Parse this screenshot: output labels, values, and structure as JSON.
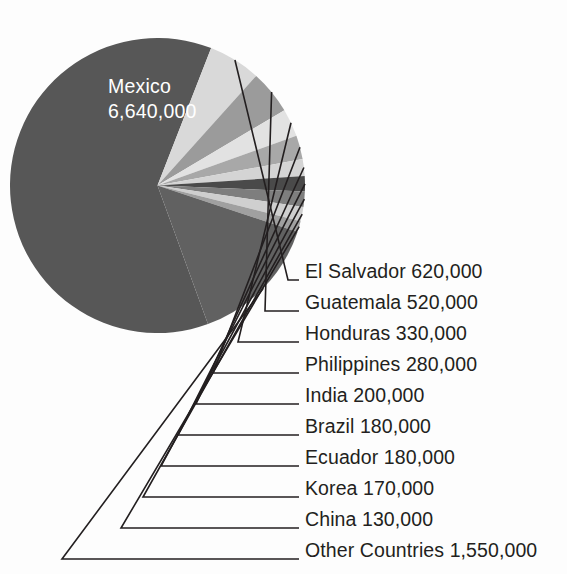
{
  "chart_data": {
    "type": "pie",
    "title": "",
    "subtitle": "",
    "xlabel": "",
    "ylabel": "",
    "legend_position": "callout-labels-right",
    "grid": false,
    "units": "people",
    "total": 10780000,
    "categories": [
      "Mexico",
      "El Salvador",
      "Guatemala",
      "Honduras",
      "Philippines",
      "India",
      "Brazil",
      "Ecuador",
      "Korea",
      "China",
      "Other Countries"
    ],
    "values": [
      6640000,
      620000,
      520000,
      330000,
      280000,
      200000,
      180000,
      180000,
      170000,
      130000,
      1550000
    ],
    "value_labels": [
      "6,640,000",
      "620,000",
      "520,000",
      "330,000",
      "280,000",
      "200,000",
      "180,000",
      "180,000",
      "170,000",
      "130,000",
      "1,550,000"
    ],
    "slice_colors": [
      "#575757",
      "#d9d9d9",
      "#9b9b9b",
      "#e2e2e2",
      "#a8a8a8",
      "#d4d4d4",
      "#4a4a4a",
      "#7e7e7e",
      "#cfcfcf",
      "#a0a0a0",
      "#616161"
    ]
  },
  "inner_label": {
    "name": "Mexico",
    "value": "6,640,000"
  },
  "callouts": [
    {
      "text": "El Salvador 620,000"
    },
    {
      "text": "Guatemala 520,000"
    },
    {
      "text": "Honduras 330,000"
    },
    {
      "text": "Philippines 280,000"
    },
    {
      "text": "India 200,000"
    },
    {
      "text": "Brazil 180,000"
    },
    {
      "text": "Ecuador 180,000"
    },
    {
      "text": "Korea 170,000"
    },
    {
      "text": "China 130,000"
    },
    {
      "text": "Other Countries 1,550,000"
    }
  ],
  "colors": {
    "background": "#fdfdfd",
    "text": "#231f20",
    "inner_text": "#ffffff",
    "leader_line": "#231f20"
  }
}
